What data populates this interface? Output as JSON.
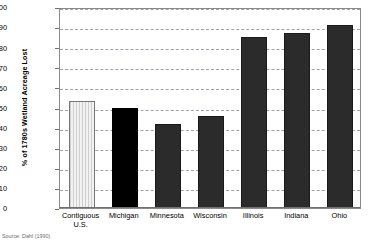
{
  "chart_data": {
    "type": "bar",
    "title": "",
    "xlabel": "",
    "ylabel": "% of 1780s Wetland Acreage Lost",
    "ylim": [
      0,
      100
    ],
    "yticks": [
      0,
      10,
      20,
      30,
      40,
      50,
      60,
      70,
      80,
      90,
      100
    ],
    "grid": "horizontal-dashed",
    "legend": "none",
    "categories": [
      "Contiguous U.S.",
      "Michigan",
      "Minnesota",
      "Wisconsin",
      "Illinois",
      "Indiana",
      "Ohio"
    ],
    "category_lines": [
      [
        "Contiguous",
        "U.S."
      ],
      [
        "Michigan"
      ],
      [
        "Minnesota"
      ],
      [
        "Wisconsin"
      ],
      [
        "Illinois"
      ],
      [
        "Indiana"
      ],
      [
        "Ohio"
      ]
    ],
    "values": [
      53,
      50,
      42,
      46,
      85,
      87,
      91
    ],
    "bar_styles": [
      "striped",
      "black",
      "dark",
      "dark",
      "dark",
      "dark",
      "dark"
    ],
    "colors": {
      "striped_fill": "#e8e8e8",
      "black_fill": "#000000",
      "dark_fill": "#2b2b2b",
      "gridline": "#9aa3ad",
      "axis": "#6f6f6f"
    }
  },
  "notes": {
    "source": "Source: Dahl (1990)"
  }
}
